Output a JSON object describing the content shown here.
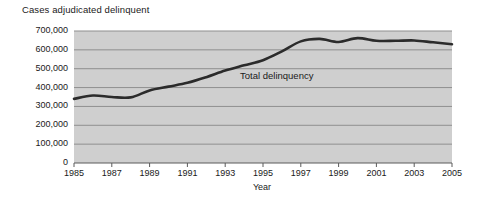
{
  "chart_data": {
    "type": "line",
    "title": "Cases adjudicated delinquent",
    "xlabel": "Year",
    "ylabel": "",
    "xlim": [
      1985,
      2005
    ],
    "ylim": [
      0,
      700000
    ],
    "grid": true,
    "legend_position": "inline-annotation",
    "background_color": "#cfcfcf",
    "gridline_color": "#8f8f8f",
    "line_color": "#2b2b2b",
    "x_tick_labels": [
      "1985",
      "1987",
      "1989",
      "1991",
      "1993",
      "1995",
      "1997",
      "1999",
      "2001",
      "2003",
      "2005"
    ],
    "x_tick_values": [
      1985,
      1987,
      1989,
      1991,
      1993,
      1995,
      1997,
      1999,
      2001,
      2003,
      2005
    ],
    "y_tick_labels": [
      "0",
      "100,000",
      "200,000",
      "300,000",
      "400,000",
      "500,000",
      "600,000",
      "700,000"
    ],
    "y_tick_values": [
      0,
      100000,
      200000,
      300000,
      400000,
      500000,
      600000,
      700000
    ],
    "x": [
      1985,
      1986,
      1987,
      1988,
      1989,
      1990,
      1991,
      1992,
      1993,
      1994,
      1995,
      1996,
      1997,
      1998,
      1999,
      2000,
      2001,
      2002,
      2003,
      2004,
      2005
    ],
    "series": [
      {
        "name": "Total delinquency",
        "annotation": "Total delinquency",
        "values": [
          340000,
          358000,
          350000,
          348000,
          385000,
          405000,
          425000,
          455000,
          490000,
          518000,
          545000,
          592000,
          645000,
          658000,
          642000,
          662000,
          648000,
          648000,
          650000,
          640000,
          630000
        ]
      }
    ]
  }
}
